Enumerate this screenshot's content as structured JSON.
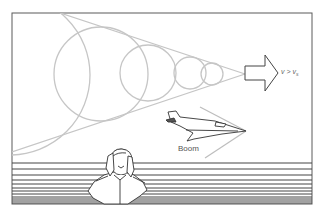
{
  "diagram": {
    "labels": {
      "velocity_v": "v",
      "velocity_op": ">",
      "velocity_vs": "v",
      "velocity_sub": "s",
      "boom": "Boom"
    },
    "elements": [
      "wavefront circles (5)",
      "Mach cone tangent lines",
      "direction arrow",
      "supersonic jet",
      "shock line",
      "man covering ears",
      "ground lines"
    ],
    "colors": {
      "wavefront": "#c4c4c4",
      "frame": "#555555",
      "ink": "#333333"
    }
  }
}
